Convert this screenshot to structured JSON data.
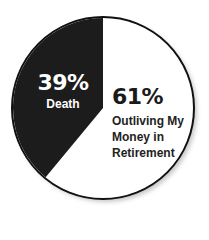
{
  "chart_data": {
    "type": "pie",
    "title": "",
    "slices": [
      {
        "label": "Death",
        "value": 39,
        "display": "39%",
        "color": "#1c1c1c",
        "text_color": "#ffffff"
      },
      {
        "label": "Outliving My Money in Retirement",
        "value": 61,
        "display": "61%",
        "color": "#ffffff",
        "text_color": "#1a1a1a"
      }
    ],
    "categories": [
      "Death",
      "Outliving My Money in Retirement"
    ],
    "values": [
      39,
      61
    ],
    "legend": "none (labels inside slices)"
  },
  "labels": {
    "death": {
      "pct": "39%",
      "name": "Death"
    },
    "outliving": {
      "pct": "61%",
      "name_lines": [
        "Outliving My",
        "Money in",
        "Retirement"
      ]
    }
  },
  "colors": {
    "dark_slice": "#1c1c1c",
    "light_slice": "#ffffff",
    "outline": "#111111",
    "shadow": "#c8c8c8"
  }
}
